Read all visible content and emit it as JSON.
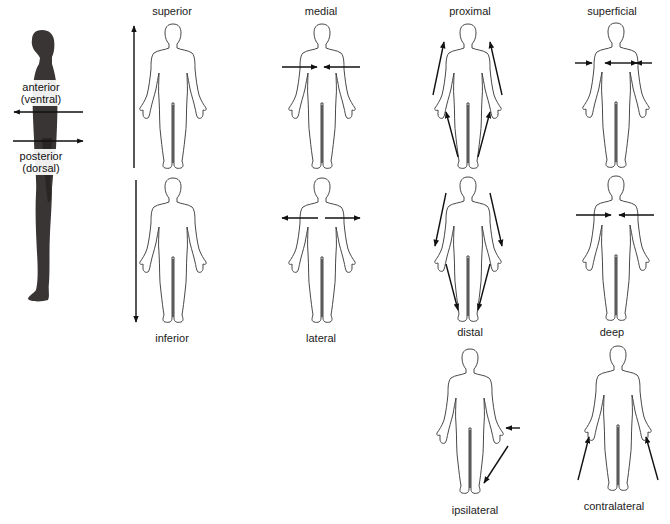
{
  "side_view": {
    "anterior_label": "anterior",
    "anterior_sub": "(ventral)",
    "posterior_label": "posterior",
    "posterior_sub": "(dorsal)"
  },
  "panels": [
    {
      "id": "superior",
      "label": "superior",
      "position": "top"
    },
    {
      "id": "inferior",
      "label": "inferior",
      "position": "bottom"
    },
    {
      "id": "medial",
      "label": "medial",
      "position": "top"
    },
    {
      "id": "lateral",
      "label": "lateral",
      "position": "bottom"
    },
    {
      "id": "proximal",
      "label": "proximal",
      "position": "top"
    },
    {
      "id": "distal",
      "label": "distal",
      "position": "bottom"
    },
    {
      "id": "superficial",
      "label": "superficial",
      "position": "top"
    },
    {
      "id": "deep",
      "label": "deep",
      "position": "bottom"
    },
    {
      "id": "ipsilateral",
      "label": "ipsilateral",
      "position": "bottom"
    },
    {
      "id": "contralateral",
      "label": "contralateral",
      "position": "bottom"
    }
  ],
  "colors": {
    "outline": "#333333",
    "arrow": "#111111",
    "silhouette": "#3a3535"
  }
}
